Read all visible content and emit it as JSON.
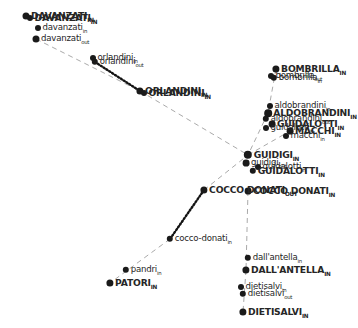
{
  "figure": {
    "type": "network-graph",
    "title": "",
    "background_color": "#ffffff",
    "node_color": "#1a1a1a",
    "label_color": "#262626",
    "edge_solid_color": "#9a9a9a",
    "edge_dotted_color": "#141414"
  },
  "chart_data": {
    "type": "scatter",
    "title": "",
    "xlabel": "",
    "ylabel": "",
    "grid": false,
    "legend": "none",
    "xlim": [
      0,
      358
    ],
    "ylim": [
      0,
      328
    ],
    "nodes": [
      {
        "id": "DAVANZATI_IN",
        "label": "DAVANZATI",
        "suffix": "IN",
        "case": "upper",
        "x": 26,
        "y": 16,
        "r": 3.5
      },
      {
        "id": "DAVANZATI_IN2",
        "label": "DAVANZATI",
        "suffix": "IN",
        "case": "upper",
        "x": 30,
        "y": 18,
        "r": 3.0
      },
      {
        "id": "davanzati_in",
        "label": "davanzati",
        "suffix": "in",
        "case": "lower",
        "x": 38,
        "y": 28,
        "r": 3.0
      },
      {
        "id": "davanzati_out",
        "label": "davanzati",
        "suffix": "out",
        "case": "lower",
        "x": 36,
        "y": 39,
        "r": 3.5
      },
      {
        "id": "orlandini_out",
        "label": "orlandini",
        "suffix": "out",
        "case": "lower",
        "x": 95,
        "y": 62,
        "r": 3.2
      },
      {
        "id": "orlandini_in",
        "label": "orlandini",
        "suffix": "in",
        "case": "lower",
        "x": 93,
        "y": 58,
        "r": 3.0
      },
      {
        "id": "ORLANDINI_IN",
        "label": "ORLANDINI",
        "suffix": "IN",
        "case": "upper",
        "x": 140,
        "y": 91,
        "r": 3.6
      },
      {
        "id": "ORLANDINI_IN2",
        "label": "ORLANDINI",
        "suffix": "IN",
        "case": "upper",
        "x": 144,
        "y": 93,
        "r": 3.0
      },
      {
        "id": "BOMBRILLA_IN",
        "label": "BOMBRILLA",
        "suffix": "IN",
        "case": "upper",
        "x": 276,
        "y": 69,
        "r": 3.6
      },
      {
        "id": "bombrilla_in",
        "label": "bombrilla",
        "suffix": "in",
        "case": "lower",
        "x": 274,
        "y": 78,
        "r": 3.2
      },
      {
        "id": "bombrilla_out",
        "label": "bombrilla",
        "suffix": "out",
        "case": "lower",
        "x": 271,
        "y": 76,
        "r": 3.0
      },
      {
        "id": "aldobrandini_in",
        "label": "aldobrandini",
        "suffix": "in",
        "case": "lower",
        "x": 270,
        "y": 106,
        "r": 3.0
      },
      {
        "id": "ALDOBRANDINI_IN",
        "label": "ALDOBRANDINI",
        "suffix": "IN",
        "case": "upper",
        "x": 268,
        "y": 113,
        "r": 3.8
      },
      {
        "id": "aldobrandini_out",
        "label": "aldobrandini",
        "suffix": "out",
        "case": "lower",
        "x": 266,
        "y": 119,
        "r": 3.2
      },
      {
        "id": "GUIDALOTTI_IN",
        "label": "GUIDALOTTI",
        "suffix": "IN",
        "case": "upper",
        "x": 272,
        "y": 124,
        "r": 3.4
      },
      {
        "id": "guidalotti_in",
        "label": "guidalotti",
        "suffix": "in",
        "case": "lower",
        "x": 266,
        "y": 128,
        "r": 3.0
      },
      {
        "id": "MACCHI_IN",
        "label": "MACCHI",
        "suffix": "IN",
        "case": "upper",
        "x": 290,
        "y": 131,
        "r": 3.4
      },
      {
        "id": "macchi_in",
        "label": "macchi",
        "suffix": "in",
        "case": "lower",
        "x": 286,
        "y": 136,
        "r": 3.0
      },
      {
        "id": "GUIDIGI",
        "label": "GUIDIGI",
        "suffix": "IN",
        "case": "upper",
        "x": 248,
        "y": 155,
        "r": 4.2
      },
      {
        "id": "guidigi_out",
        "label": "guidigi",
        "suffix": "out",
        "case": "lower",
        "x": 246,
        "y": 163,
        "r": 3.4
      },
      {
        "id": "guidalotti_out",
        "label": "guidalotti",
        "suffix": "in",
        "case": "lower",
        "x": 258,
        "y": 167,
        "r": 3.0
      },
      {
        "id": "GUIDALOTTI_OUT",
        "label": "GUIDALOTTI",
        "suffix": "IN",
        "case": "upper",
        "x": 253,
        "y": 171,
        "r": 3.2
      },
      {
        "id": "COCCO_DONATI_OUT",
        "label": "COCCO DONATI",
        "suffix": "OUT",
        "case": "upper",
        "x": 204,
        "y": 190,
        "r": 3.6
      },
      {
        "id": "COCCO_DONATI_IN",
        "label": "COCCO DONATI",
        "suffix": "IN",
        "case": "upper",
        "x": 248,
        "y": 191,
        "r": 3.4
      },
      {
        "id": "cocco_donati_in",
        "label": "cocco-donati",
        "suffix": "in",
        "case": "lower",
        "x": 170,
        "y": 239,
        "r": 3.2
      },
      {
        "id": "pandri_in",
        "label": "pandri",
        "suffix": "in",
        "case": "lower",
        "x": 126,
        "y": 270,
        "r": 3.2
      },
      {
        "id": "PATORI_IN",
        "label": "PATORI",
        "suffix": "IN",
        "case": "upper",
        "x": 110,
        "y": 283,
        "r": 3.6
      },
      {
        "id": "dallantella_in",
        "label": "dall'antella",
        "suffix": "in",
        "case": "lower",
        "x": 248,
        "y": 258,
        "r": 3.2
      },
      {
        "id": "DALLANTELLA_IN",
        "label": "DALL'ANTELLA",
        "suffix": "IN",
        "case": "upper",
        "x": 246,
        "y": 270,
        "r": 3.6
      },
      {
        "id": "dietisalvi_in",
        "label": "dietisalvi",
        "suffix": "in",
        "case": "lower",
        "x": 241,
        "y": 287,
        "r": 3.0
      },
      {
        "id": "dietisalvi_out",
        "label": "dietisalvi",
        "suffix": "out",
        "case": "lower",
        "x": 243,
        "y": 294,
        "r": 3.2
      },
      {
        "id": "DIETISALVI_IN",
        "label": "DIETISALVI",
        "suffix": "IN",
        "case": "upper",
        "x": 243,
        "y": 312,
        "r": 3.6
      }
    ],
    "edges": [
      {
        "source": "davanzati_out",
        "target": "ORLANDINI_IN",
        "style": "dashed",
        "color": "#9a9a9a"
      },
      {
        "source": "orlandini_out",
        "target": "ORLANDINI_IN",
        "style": "dotted",
        "color": "#141414"
      },
      {
        "source": "ORLANDINI_IN",
        "target": "GUIDIGI",
        "style": "dashed",
        "color": "#9a9a9a"
      },
      {
        "source": "COCCO_DONATI_OUT",
        "target": "GUIDIGI",
        "style": "dashed",
        "color": "#9a9a9a"
      },
      {
        "source": "COCCO_DONATI_OUT",
        "target": "cocco_donati_in",
        "style": "dotted",
        "color": "#141414"
      },
      {
        "source": "cocco_donati_in",
        "target": "PATORI_IN",
        "style": "dashed",
        "color": "#9a9a9a"
      },
      {
        "source": "COCCO_DONATI_IN",
        "target": "DALLANTELLA_IN",
        "style": "dashed",
        "color": "#9a9a9a"
      },
      {
        "source": "DALLANTELLA_IN",
        "target": "DIETISALVI_IN",
        "style": "dashed",
        "color": "#9a9a9a"
      },
      {
        "source": "BOMBRILLA_IN",
        "target": "ALDOBRANDINI_IN",
        "style": "dashed",
        "color": "#9a9a9a"
      },
      {
        "source": "ALDOBRANDINI_IN",
        "target": "GUIDIGI",
        "style": "dashed",
        "color": "#9a9a9a"
      },
      {
        "source": "GUIDIGI",
        "target": "MACCHI_IN",
        "style": "dashed",
        "color": "#9a9a9a"
      }
    ]
  }
}
